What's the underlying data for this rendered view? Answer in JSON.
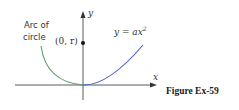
{
  "figure": {
    "caption": "Figure Ex-59",
    "labels": {
      "arc_line1": "Arc of",
      "arc_line2": "circle",
      "point": "(0, r)",
      "parabola": "y = ax",
      "parabola_exp": "2",
      "x_axis": "x",
      "y_axis": "y"
    },
    "colors": {
      "arc": "#5f9f6e",
      "parabola": "#4a5fc8",
      "axis": "#333333",
      "point": "#111111"
    }
  }
}
